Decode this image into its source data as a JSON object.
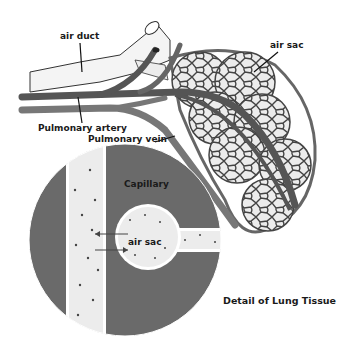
{
  "title": "Detail of Lung Tissue",
  "labels": {
    "air_duct": "air duct",
    "air_sac_top": "air sac",
    "pulmonary_artery": "Pulmonary artery",
    "pulmonary_vein": "Pulmonary vein",
    "capillary": "Capillary",
    "air_sac_detail": "air sac"
  },
  "caption": "Detail of Lung Tissue",
  "colors": {
    "artery": "#555555",
    "vein": "#777777",
    "duct_fill": "#f2f2f2",
    "sac_fill": "#e8e8e8",
    "capillary_bg": "#6a6a6a",
    "outline": "#333333"
  }
}
